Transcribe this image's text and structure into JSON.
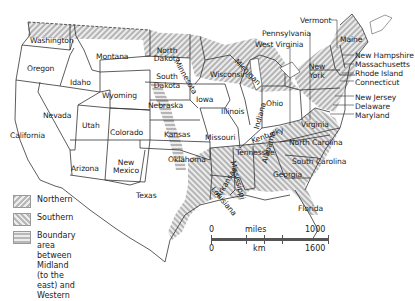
{
  "map": {
    "title": "US dialect regions",
    "colors": {
      "hatch_dark": "#b8b8b8",
      "hatch_light": "#ececec",
      "border": "#333333",
      "label": "#222222"
    },
    "states": {
      "washington": "Washington",
      "oregon": "Oregon",
      "california": "California",
      "idaho": "Idaho",
      "nevada": "Nevada",
      "montana": "Montana",
      "wyoming": "Wyoming",
      "utah": "Utah",
      "arizona": "Arizona",
      "colorado": "Colorado",
      "new_mexico_1": "New",
      "new_mexico_2": "Mexico",
      "north_dakota_1": "North",
      "north_dakota_2": "Dakota",
      "south_dakota_1": "South",
      "south_dakota_2": "Dakota",
      "nebraska": "Nebraska",
      "kansas": "Kansas",
      "oklahoma": "Oklahoma",
      "texas": "Texas",
      "minnesota": "Minnesota",
      "iowa": "Iowa",
      "missouri": "Missouri",
      "arkansas": "Arkansas",
      "louisiana": "Louisiana",
      "wisconsin": "Wisconsin",
      "illinois": "Illinois",
      "michigan": "Michigan",
      "indiana": "Indiana",
      "ohio": "Ohio",
      "kentucky": "Kentucky",
      "tennessee": "Tennessee",
      "mississippi": "Mississippi",
      "alabama": "Alabama",
      "georgia": "Georgia",
      "florida": "Florida",
      "south_carolina": "South Carolina",
      "north_carolina": "North Carolina",
      "virginia": "Virginia",
      "west_virginia": "West Virginia",
      "pennsylvania": "Pennsylvania",
      "new_york_1": "New",
      "new_york_2": "York",
      "vermont": "Vermont",
      "maine": "Maine",
      "new_hampshire": "New Hampshire",
      "massachusetts": "Massachusetts",
      "rhode_island": "Rhode Island",
      "connecticut": "Connecticut",
      "new_jersey": "New Jersey",
      "delaware": "Delaware",
      "maryland": "Maryland"
    }
  },
  "legend": {
    "items": [
      {
        "pattern": "northern-hatch",
        "label": "Northern"
      },
      {
        "pattern": "southern-hatch",
        "label": "Southern"
      },
      {
        "pattern": "boundary-hatch",
        "label": "Boundary area between Midland",
        "label2": "(to the east) and Western"
      }
    ]
  },
  "scale": {
    "top_left": "0",
    "top_unit": "miles",
    "top_right": "1000",
    "bottom_left": "0",
    "bottom_unit": "km",
    "bottom_right": "1600"
  }
}
